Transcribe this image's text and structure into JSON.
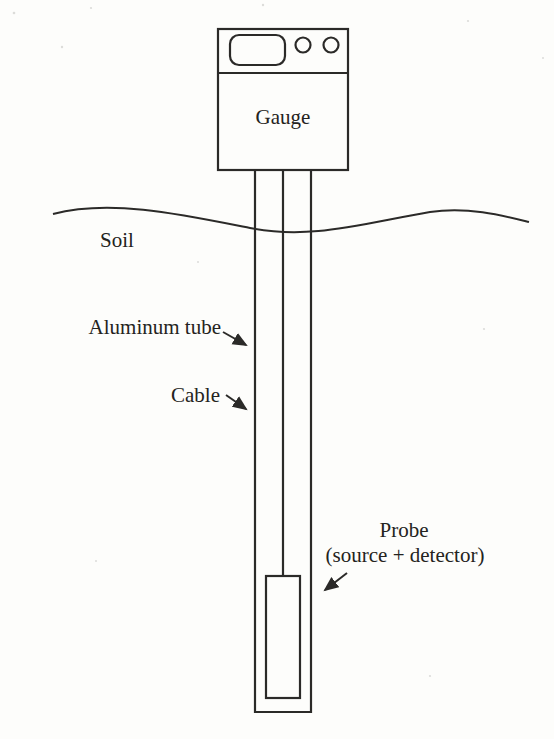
{
  "figure": {
    "background": "#fdfdfb",
    "ink": "#2b2a28",
    "text_color": "#242320",
    "labels": {
      "gauge": "Gauge",
      "soil": "Soil",
      "aluminum_tube": "Aluminum tube",
      "cable": "Cable",
      "probe": "Probe",
      "probe_sub": "(source + detector)"
    }
  }
}
